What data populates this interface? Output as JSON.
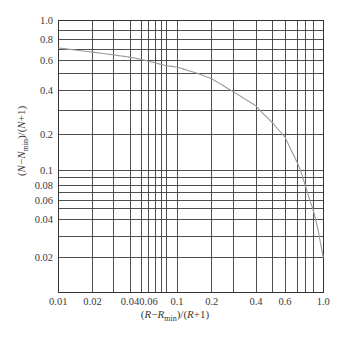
{
  "chart_data": {
    "type": "line",
    "title": "",
    "xlabel": "(R−R_min)/(R+1)",
    "ylabel": "(N−N_min)/(N+1)",
    "xscale": "log",
    "yscale": "log",
    "xlim": [
      0.01,
      1.0
    ],
    "ylim": [
      0.01,
      1.0
    ],
    "grid": true,
    "legend": "none",
    "x_ticks": [
      "0.01",
      "0.02",
      "0.04",
      "0.06",
      "0.1",
      "0.2",
      "0.4",
      "0.6",
      "1.0"
    ],
    "y_ticks": [
      "1.0",
      "0.8",
      "0.6",
      "0.4",
      "0.2",
      "0.1",
      "0.08",
      "0.06",
      "0.04",
      "0.02"
    ],
    "x_gridlines": [
      0.01,
      0.02,
      0.03,
      0.04,
      0.05,
      0.06,
      0.07,
      0.08,
      0.09,
      0.1,
      0.2,
      0.3,
      0.4,
      0.5,
      0.6,
      0.7,
      0.8,
      0.9,
      1.0
    ],
    "y_gridlines": [
      0.01,
      0.02,
      0.03,
      0.04,
      0.05,
      0.06,
      0.07,
      0.08,
      0.09,
      0.1,
      0.2,
      0.3,
      0.4,
      0.5,
      0.6,
      0.7,
      0.8,
      0.9,
      1.0
    ],
    "series": [
      {
        "name": "correlation curve",
        "x": [
          0.01,
          0.02,
          0.03,
          0.04,
          0.05,
          0.06,
          0.08,
          0.1,
          0.15,
          0.2,
          0.3,
          0.4,
          0.5,
          0.6,
          0.7,
          0.8,
          0.9,
          0.95,
          1.0
        ],
        "y": [
          0.71,
          0.67,
          0.645,
          0.625,
          0.605,
          0.59,
          0.565,
          0.545,
          0.5,
          0.465,
          0.39,
          0.32,
          0.245,
          0.19,
          0.115,
          0.078,
          0.047,
          0.032,
          0.02
        ]
      }
    ]
  },
  "axis_labels": {
    "x": [
      {
        "t": "(",
        "italic": false,
        "sub": false
      },
      {
        "t": "R",
        "italic": true,
        "sub": false
      },
      {
        "t": "−",
        "italic": false,
        "sub": false
      },
      {
        "t": "R",
        "italic": true,
        "sub": false
      },
      {
        "t": "min",
        "italic": false,
        "sub": true
      },
      {
        "t": ")/(",
        "italic": false,
        "sub": false
      },
      {
        "t": "R",
        "italic": true,
        "sub": false
      },
      {
        "t": "+1)",
        "italic": false,
        "sub": false
      }
    ],
    "y": [
      {
        "t": "(",
        "italic": false,
        "sub": false
      },
      {
        "t": "N",
        "italic": true,
        "sub": false
      },
      {
        "t": "−",
        "italic": false,
        "sub": false
      },
      {
        "t": "N",
        "italic": true,
        "sub": false
      },
      {
        "t": "min",
        "italic": false,
        "sub": true
      },
      {
        "t": ")/(",
        "italic": false,
        "sub": false
      },
      {
        "t": "N",
        "italic": true,
        "sub": false
      },
      {
        "t": "+1)",
        "italic": false,
        "sub": false
      }
    ]
  },
  "colors": {
    "grid": "#3c3c3c",
    "curve": "#9a9a9a",
    "text": "#3a3a3a",
    "background": "#ffffff"
  }
}
